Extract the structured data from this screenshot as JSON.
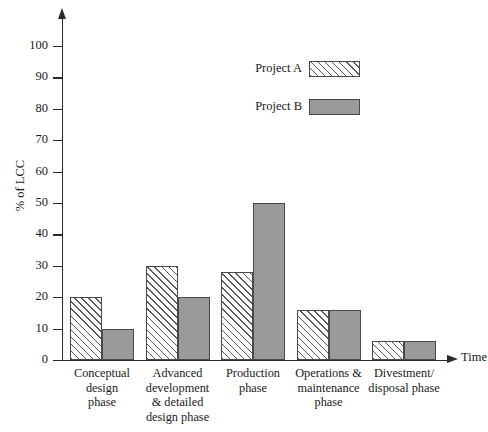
{
  "chart_data": {
    "type": "bar",
    "title": "",
    "xlabel": "Time",
    "ylabel": "% of LCC",
    "ylim": [
      0,
      100
    ],
    "yticks": [
      0,
      10,
      20,
      30,
      40,
      50,
      60,
      70,
      80,
      90,
      100
    ],
    "ytick_labels": [
      "0",
      "10",
      "20",
      "30",
      "40",
      "50",
      "60",
      "70",
      "80",
      "90",
      "100"
    ],
    "grid": false,
    "legend_position": "upper center",
    "categories": [
      "Conceptual\ndesign\nphase",
      "Advanced\ndevelopment\n& detailed\ndesign phase",
      "Production\nphase",
      "Operations &\nmaintenance\nphase",
      "Divestment/\ndisposal phase"
    ],
    "series": [
      {
        "name": "Project A",
        "fill": "diagonal-hatch",
        "color": "#ffffff",
        "hatch_color": "#5a5a5a",
        "values": [
          20,
          30,
          28,
          16,
          6
        ]
      },
      {
        "name": "Project B",
        "fill": "solid",
        "color": "#9a9a9a",
        "hatch_color": "",
        "values": [
          10,
          20,
          50,
          16,
          6
        ]
      }
    ]
  },
  "legend": {
    "items": [
      {
        "label": "Project A"
      },
      {
        "label": "Project B"
      }
    ]
  },
  "axes": {
    "x_title": "Time",
    "y_title": "% of LCC"
  }
}
